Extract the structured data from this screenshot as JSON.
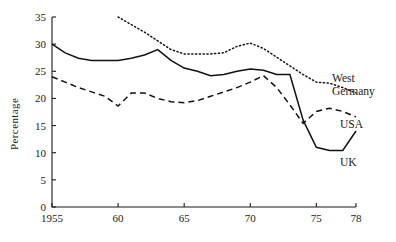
{
  "chart_data": {
    "type": "line",
    "title": "",
    "subtitle": "",
    "xlabel": "",
    "ylabel": "Percentage",
    "xlim": [
      1955,
      1978
    ],
    "ylim": [
      0,
      35
    ],
    "grid": false,
    "legend_position": "inline-right",
    "x_ticks": [
      {
        "value": 1955,
        "label": "1955"
      },
      {
        "value": 1960,
        "label": "60"
      },
      {
        "value": 1965,
        "label": "65"
      },
      {
        "value": 1970,
        "label": "70"
      },
      {
        "value": 1975,
        "label": "75"
      },
      {
        "value": 1978,
        "label": "78"
      }
    ],
    "y_ticks": [
      {
        "value": 0,
        "label": "0"
      },
      {
        "value": 5,
        "label": "5"
      },
      {
        "value": 10,
        "label": "10"
      },
      {
        "value": 15,
        "label": "15"
      },
      {
        "value": 20,
        "label": "20"
      },
      {
        "value": 25,
        "label": "25"
      },
      {
        "value": 30,
        "label": "30"
      },
      {
        "value": 35,
        "label": "35"
      }
    ],
    "series": [
      {
        "name": "West Germany",
        "style": "dotted",
        "color": "#111111",
        "x": [
          1960,
          1961,
          1962,
          1963,
          1964,
          1965,
          1966,
          1967,
          1968,
          1969,
          1970,
          1971,
          1972,
          1973,
          1974,
          1975,
          1976,
          1977,
          1978
        ],
        "values": [
          35.0,
          33.6,
          32.2,
          30.6,
          29.0,
          28.2,
          28.2,
          28.2,
          28.4,
          29.6,
          30.2,
          29.2,
          27.6,
          26.0,
          24.4,
          23.0,
          22.8,
          22.0,
          21.0
        ]
      },
      {
        "name": "USA",
        "style": "dashed",
        "color": "#111111",
        "x": [
          1955,
          1956,
          1957,
          1958,
          1959,
          1960,
          1961,
          1962,
          1963,
          1964,
          1965,
          1966,
          1967,
          1968,
          1969,
          1970,
          1971,
          1972,
          1973,
          1974,
          1975,
          1976,
          1977,
          1978
        ],
        "values": [
          24.0,
          23.0,
          22.0,
          21.2,
          20.4,
          18.6,
          21.0,
          21.0,
          20.0,
          19.4,
          19.2,
          19.6,
          20.4,
          21.2,
          22.0,
          23.0,
          24.2,
          22.0,
          18.8,
          15.4,
          17.6,
          18.2,
          17.6,
          16.6
        ]
      },
      {
        "name": "UK",
        "style": "solid",
        "color": "#111111",
        "x": [
          1955,
          1956,
          1957,
          1958,
          1959,
          1960,
          1961,
          1962,
          1963,
          1964,
          1965,
          1966,
          1967,
          1968,
          1969,
          1970,
          1971,
          1972,
          1973,
          1974,
          1975,
          1976,
          1977,
          1978
        ],
        "values": [
          30.0,
          28.4,
          27.4,
          27.0,
          27.0,
          27.0,
          27.4,
          28.0,
          29.0,
          27.0,
          25.6,
          25.0,
          24.2,
          24.4,
          25.0,
          25.4,
          25.2,
          24.4,
          24.4,
          16.0,
          11.0,
          10.4,
          10.4,
          14.0
        ]
      }
    ],
    "annotations": [
      {
        "text": "West",
        "series": "West Germany"
      },
      {
        "text": "Germany",
        "series": "West Germany"
      },
      {
        "text": "USA",
        "series": "USA"
      },
      {
        "text": "UK",
        "series": "UK"
      }
    ]
  },
  "labels": {
    "y_axis_title": "Percentage",
    "west_germany_line1": "West",
    "west_germany_line2": "Germany",
    "usa": "USA",
    "uk": "UK"
  }
}
